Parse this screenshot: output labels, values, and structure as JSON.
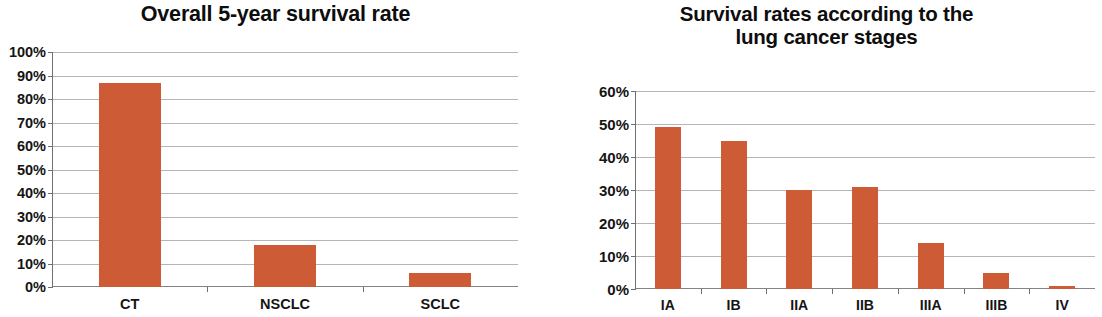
{
  "chart_data": [
    {
      "id": "overall-survival",
      "type": "bar",
      "title": "Overall 5-year survival rate",
      "title_lines": [
        "Overall 5-year survival rate"
      ],
      "xlabel": "",
      "ylabel": "",
      "categories": [
        "CT",
        "NSCLC",
        "SCLC"
      ],
      "values": [
        87,
        18,
        6
      ],
      "ylim": [
        0,
        100
      ],
      "ytick_step": 10,
      "ytick_labels": [
        "0%",
        "10%",
        "20%",
        "30%",
        "40%",
        "50%",
        "60%",
        "70%",
        "80%",
        "90%",
        "100%"
      ],
      "grid": true,
      "legend": "none",
      "bar_color": "#cd5b36",
      "axis_color": "#6f6f6f",
      "grid_color": "#a8a8a8"
    },
    {
      "id": "survival-by-stage",
      "type": "bar",
      "title": "Survival rates according to the lung cancer stages",
      "title_lines": [
        "Survival rates according to the",
        "lung cancer stages"
      ],
      "xlabel": "",
      "ylabel": "",
      "categories": [
        "IA",
        "IB",
        "IIA",
        "IIB",
        "IIIA",
        "IIIB",
        "IV"
      ],
      "values": [
        49,
        45,
        30,
        31,
        14,
        5,
        1
      ],
      "ylim": [
        0,
        60
      ],
      "ytick_step": 10,
      "ytick_labels": [
        "0%",
        "10%",
        "20%",
        "30%",
        "40%",
        "50%",
        "60%"
      ],
      "grid": true,
      "legend": "none",
      "bar_color": "#cd5b36",
      "axis_color": "#6f6f6f",
      "grid_color": "#a8a8a8"
    }
  ]
}
